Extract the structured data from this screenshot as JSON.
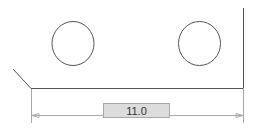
{
  "canvas": {
    "background": "#ffffff",
    "line_color": "#555555",
    "dimension_color": "#9a9a9a"
  },
  "dimension": {
    "value": "11.0",
    "input_bg": "#dcdcdc"
  }
}
